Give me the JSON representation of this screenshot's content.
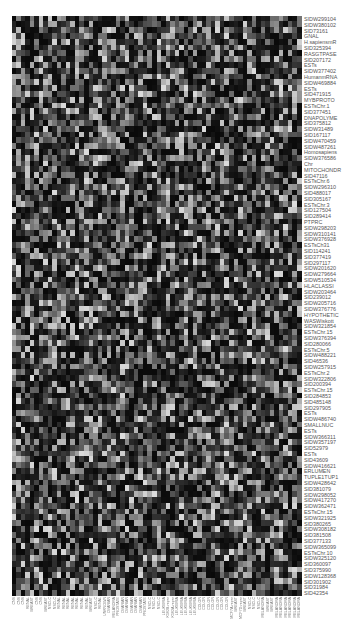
{
  "chart_data": {
    "type": "heatmap",
    "title": "",
    "colormap": "grayscale (black = low, white = high)",
    "n_rows": 100,
    "n_cols": 64,
    "legend": "none",
    "grid": false,
    "row_labels": [
      "SIDW299104",
      "SIDW380102",
      "SID73161",
      "GNAL",
      "H.sapiensmR",
      "SID325394",
      "RASGTPASE",
      "SID207172",
      "ESTs",
      "SIDW377402",
      "HumanmRNA",
      "SIDW469884",
      "ESTs",
      "SID471915",
      "MYBPROTO",
      "ESTsChr.1",
      "SID377451",
      "DNAPOLYME",
      "SID375812",
      "SIDW31489",
      "SID167117",
      "SIDW470459",
      "SIDW487261",
      "Homosapiens",
      "SIDW376586",
      "Chr",
      "MITOCHONDR",
      "SID47116",
      "ESTsChr.6",
      "SIDW296310",
      "SID488017",
      "SID305167",
      "ESTsChr.3",
      "SID127504",
      "SID289414",
      "PTPRC",
      "SIDW298203",
      "SIDW310141",
      "SIDW376928",
      "ESTsCh31",
      "SID114241",
      "SID377419",
      "SID297117",
      "SIDW201620",
      "SIDW279664",
      "SIDW510534",
      "HLACLASSI",
      "SIDW203464",
      "SID239012",
      "SIDW205716",
      "SIDW376776",
      "HYPOTHETIC",
      "WASWiskott",
      "SIDW321854",
      "ESTsChr.15",
      "SIDW376394",
      "SID280066",
      "ESTsChr.5",
      "SIDW488221",
      "SID46536",
      "SIDW257915",
      "ESTsChr.2",
      "SIDW322806",
      "SID200394",
      "ESTsChr.15",
      "SID284853",
      "SID485148",
      "SID297905",
      "ESTs",
      "SIDW486740",
      "SMALLNUC",
      "ESTs",
      "SIDW366311",
      "SIDW357197",
      "SID52979",
      "ESTs",
      "SID43609",
      "SIDW416621",
      "ERLUMEN",
      "TUPLE1TUP1",
      "SIDW428642",
      "SID381079",
      "SIDW298052",
      "SIDW417270",
      "SIDW362471",
      "ESTsChr.15",
      "SIDW321925",
      "SID380265",
      "SIDW308182",
      "SID381508",
      "SID377133",
      "SIDW365099",
      "ESTsChr.10",
      "SIDW325120",
      "SID360097",
      "SID375990",
      "SIDW128368",
      "SID301902",
      "SID31984",
      "SID42354"
    ],
    "col_labels": [
      "CNS",
      "CNS",
      "CNS",
      "RENAL",
      "BREAST",
      "CNS",
      "CNS",
      "BREAST",
      "NSCLC",
      "NSCLC",
      "RENAL",
      "RENAL",
      "RENAL",
      "RENAL",
      "RENAL",
      "RENAL",
      "RENAL",
      "BREAST",
      "NSCLC",
      "RENAL",
      "UNKNOWN",
      "OVARIAN",
      "MELANOMA",
      "PROSTATE",
      "OVARIAN",
      "OVARIAN",
      "OVARIAN",
      "OVARIAN",
      "OVARIAN",
      "PROSTATE",
      "NSCLC",
      "NSCLC",
      "NSCLC",
      "LEUKEMIA",
      "K562B-repro",
      "K562A-repro",
      "LEUKEMIA",
      "LEUKEMIA",
      "LEUKEMIA",
      "LEUKEMIA",
      "LEUKEMIA",
      "COLON",
      "COLON",
      "COLON",
      "COLON",
      "COLON",
      "COLON",
      "COLON",
      "MCF7A-repro",
      "BREAST",
      "MCF7D-repro",
      "BREAST",
      "NSCLC",
      "NSCLC",
      "NSCLC",
      "MELANOMA",
      "BREAST",
      "BREAST",
      "MELANOMA",
      "MELANOMA",
      "MELANOMA",
      "MELANOMA",
      "MELANOMA",
      "MELANOMA"
    ],
    "value_range": [
      0,
      1
    ],
    "seed": 20240611
  }
}
